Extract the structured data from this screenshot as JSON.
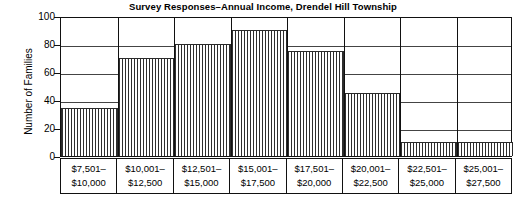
{
  "chart_data": {
    "type": "bar",
    "title": "Survey Responses–Annual Income, Drendel Hill Township",
    "xlabel": "",
    "ylabel": "Number of Families",
    "ylim": [
      0,
      100
    ],
    "ytick_labels": [
      "100",
      "80",
      "60",
      "40",
      "20",
      "0"
    ],
    "ytick_values": [
      100,
      80,
      60,
      40,
      20,
      0
    ],
    "grid": true,
    "legend": "none",
    "categories": [
      "$7,501– $10,000",
      "$10,001– $12,500",
      "$12,501– $15,000",
      "$15,001– $17,500",
      "$17,501– $20,000",
      "$20,001– $22,500",
      "$22,501– $25,000",
      "$25,001– $27,500"
    ],
    "bins": [
      {
        "line1": "$7,501–",
        "line2": "$10,000",
        "value": 34
      },
      {
        "line1": "$10,001–",
        "line2": "$12,500",
        "value": 70
      },
      {
        "line1": "$12,501–",
        "line2": "$15,000",
        "value": 80
      },
      {
        "line1": "$15,001–",
        "line2": "$17,500",
        "value": 90
      },
      {
        "line1": "$17,501–",
        "line2": "$20,000",
        "value": 75
      },
      {
        "line1": "$20,001–",
        "line2": "$22,500",
        "value": 45
      },
      {
        "line1": "$22,501–",
        "line2": "$25,000",
        "value": 10
      },
      {
        "line1": "$25,001–",
        "line2": "$27,500",
        "value": 10
      }
    ],
    "values": [
      34,
      70,
      80,
      90,
      75,
      45,
      10,
      10
    ],
    "colors": {
      "bar_fill": "#ffffff",
      "bar_hatch": "#2e2e2e",
      "bar_edge": "#2a2a2a",
      "axis": "#111111",
      "grid": "#444444",
      "text": "#000000",
      "background": "#ffffff"
    }
  }
}
